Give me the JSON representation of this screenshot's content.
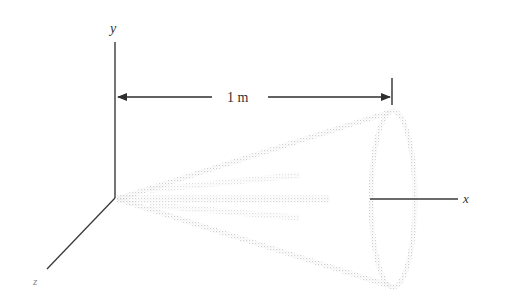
{
  "diagram": {
    "type": "3d-axes-with-cone",
    "axes": {
      "y_label": "y",
      "x_label": "x",
      "z_label": "z"
    },
    "dimension": {
      "label": "1 m"
    },
    "colors": {
      "line": "#3a3a3a",
      "cone": "#d8d8d8",
      "label": "#333333"
    }
  }
}
